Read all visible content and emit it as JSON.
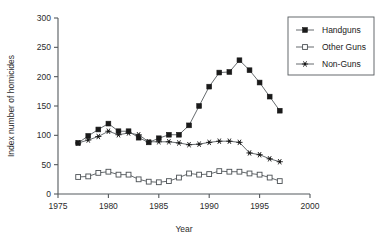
{
  "chart_data": {
    "type": "line",
    "title": "",
    "xlabel": "Year",
    "ylabel": "Index number of homicides",
    "xlim": [
      1975,
      2000
    ],
    "ylim": [
      0,
      300
    ],
    "xticks": [
      1975,
      1980,
      1985,
      1990,
      1995,
      2000
    ],
    "yticks": [
      0,
      50,
      100,
      150,
      200,
      250,
      300
    ],
    "grid": false,
    "legend_position": "top-right",
    "x": [
      1977,
      1978,
      1979,
      1980,
      1981,
      1982,
      1983,
      1984,
      1985,
      1986,
      1987,
      1988,
      1989,
      1990,
      1991,
      1992,
      1993,
      1994,
      1995,
      1996,
      1997
    ],
    "series": [
      {
        "name": "Handguns",
        "marker": "filled-square",
        "values": [
          87,
          99,
          110,
          120,
          107,
          107,
          96,
          88,
          95,
          101,
          101,
          117,
          150,
          183,
          207,
          208,
          228,
          211,
          190,
          166,
          142
        ]
      },
      {
        "name": "Other Guns",
        "marker": "open-square",
        "values": [
          29,
          30,
          36,
          38,
          33,
          33,
          25,
          21,
          20,
          22,
          28,
          35,
          33,
          34,
          39,
          38,
          38,
          35,
          33,
          28,
          22
        ]
      },
      {
        "name": "Non-Guns",
        "marker": "star",
        "values": [
          87,
          92,
          98,
          107,
          101,
          104,
          101,
          89,
          89,
          89,
          87,
          84,
          85,
          88,
          90,
          90,
          88,
          70,
          67,
          60,
          55
        ]
      }
    ]
  },
  "legend": {
    "items": [
      {
        "label": "Handguns"
      },
      {
        "label": "Other Guns"
      },
      {
        "label": "Non-Guns"
      }
    ]
  }
}
